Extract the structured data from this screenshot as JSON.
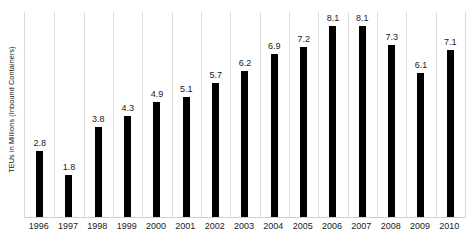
{
  "chart_data": {
    "type": "bar",
    "title": "",
    "subtitle": "",
    "xlabel": "",
    "ylabel": "TEUs in Millions (Inbound Containers)",
    "categories": [
      "1996",
      "1997",
      "1998",
      "1999",
      "2000",
      "2001",
      "2002",
      "2003",
      "2004",
      "2005",
      "2006",
      "2007",
      "2008",
      "2009",
      "2010"
    ],
    "values": [
      2.8,
      1.8,
      3.8,
      4.3,
      4.9,
      5.1,
      5.7,
      6.2,
      6.9,
      7.2,
      8.1,
      8.1,
      7.3,
      6.1,
      7.1
    ],
    "value_labels": [
      "2.8",
      "1.8",
      "3.8",
      "4.3",
      "4.9",
      "5.1",
      "5.7",
      "6.2",
      "6.9",
      "7.2",
      "8.1",
      "8.1",
      "7.3",
      "6.1",
      "7.1"
    ],
    "ylim": [
      0,
      8.7
    ],
    "grid": "vertical",
    "legend": "none",
    "bar_color": "#000000",
    "gridline_color": "#dcdcdc",
    "background_color": "#ffffff",
    "data_labels_shown": true,
    "y_tick_labels": []
  },
  "axes": {
    "y_title": "TEUs in Millions (Inbound Containers)"
  }
}
